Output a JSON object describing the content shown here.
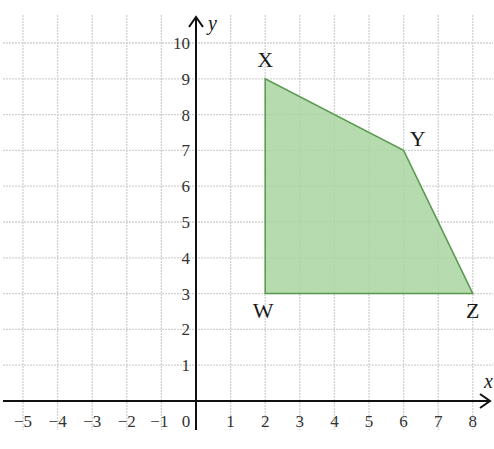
{
  "diagram": {
    "type": "coordinate-plane-polygon",
    "axes": {
      "x_label": "x",
      "y_label": "y",
      "x_ticks": [
        "−5",
        "−4",
        "−3",
        "−2",
        "−1",
        "0",
        "1",
        "2",
        "3",
        "4",
        "5",
        "6",
        "7",
        "8"
      ],
      "y_ticks": [
        "1",
        "2",
        "3",
        "4",
        "5",
        "6",
        "7",
        "8",
        "9",
        "10"
      ],
      "x_range": [
        -5,
        8
      ],
      "y_range": [
        0,
        10
      ]
    },
    "polygon": {
      "name": "WXYZ",
      "fill_color": "#a8d5a0",
      "stroke_color": "#5a9a50",
      "vertices": [
        {
          "label": "W",
          "x": 2,
          "y": 3
        },
        {
          "label": "X",
          "x": 2,
          "y": 9
        },
        {
          "label": "Y",
          "x": 6,
          "y": 7
        },
        {
          "label": "Z",
          "x": 8,
          "y": 3
        }
      ]
    },
    "colors": {
      "grid": "#cfd3cf",
      "axis": "#111111",
      "background": "#ffffff"
    }
  }
}
